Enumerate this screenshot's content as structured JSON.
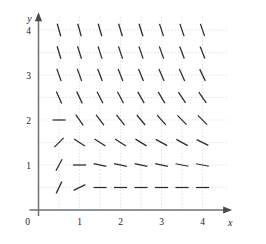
{
  "figure": {
    "kind": "slope-field",
    "background_color": "#ffffff"
  },
  "axes": {
    "x_label": "x",
    "y_label": "y",
    "origin_label": "0",
    "x_tick_labels": [
      "1",
      "2",
      "3",
      "4"
    ],
    "y_tick_labels": [
      "1",
      "2",
      "3",
      "4"
    ],
    "x_ticks": [
      1,
      2,
      3,
      4
    ],
    "y_ticks": [
      1,
      2,
      3,
      4
    ],
    "xlim": [
      0,
      4.65
    ],
    "ylim": [
      0,
      4.35
    ],
    "axis_color": "#6f6f78",
    "grid_color": "#d9d4dd",
    "grid": true,
    "tick_label_color": "#222222"
  },
  "chart_data": {
    "type": "scatter",
    "title": "",
    "xlabel": "x",
    "ylabel": "y",
    "xlim": [
      0,
      4.65
    ],
    "ylim": [
      0,
      4.35
    ],
    "grid": true,
    "legend": "none",
    "segment_color": "#2b2b2b",
    "segment_length": 13,
    "x": [
      0.5,
      1,
      1.5,
      2,
      2.5,
      3,
      3.5,
      4
    ],
    "y": [
      0.5,
      1,
      1.5,
      2,
      2.5,
      3,
      3.5,
      4
    ],
    "slope_rows": [
      {
        "y": 4,
        "slopes": [
          -3.2,
          -3.2,
          -3.1,
          -3.0,
          -2.9,
          -2.8,
          -2.7,
          -2.6
        ]
      },
      {
        "y": 3.5,
        "slopes": [
          -3.0,
          -2.9,
          -2.8,
          -2.7,
          -2.6,
          -2.5,
          -2.4,
          -2.3
        ]
      },
      {
        "y": 3,
        "slopes": [
          -2.6,
          -2.5,
          -2.4,
          -2.3,
          -2.2,
          -2.1,
          -2.0,
          -1.9
        ]
      },
      {
        "y": 2.5,
        "slopes": [
          -2.0,
          -1.9,
          -1.8,
          -1.7,
          -1.6,
          -1.5,
          -1.4,
          -1.3
        ]
      },
      {
        "y": 2,
        "slopes": [
          0.0,
          -1.3,
          -1.2,
          -1.15,
          -1.1,
          -1.0,
          -0.95,
          -0.9
        ]
      },
      {
        "y": 1.5,
        "slopes": [
          0.9,
          -0.6,
          -0.6,
          -0.6,
          -0.55,
          -0.5,
          -0.5,
          -0.45
        ]
      },
      {
        "y": 1,
        "slopes": [
          1.7,
          0.0,
          -0.2,
          -0.2,
          -0.2,
          -0.2,
          -0.18,
          -0.18
        ]
      },
      {
        "y": 0.5,
        "slopes": [
          1.9,
          0.45,
          0.0,
          0.0,
          0.0,
          0.0,
          0.0,
          0.0
        ]
      }
    ]
  }
}
